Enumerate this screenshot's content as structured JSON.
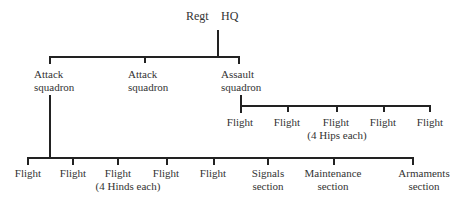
{
  "root": {
    "label_left": "Regt",
    "label_right": "HQ"
  },
  "squadrons": [
    {
      "line1": "Attack",
      "line2": "squadron"
    },
    {
      "line1": "Attack",
      "line2": "squadron"
    },
    {
      "line1": "Assault",
      "line2": "squadron"
    }
  ],
  "assault_flights": {
    "items": [
      "Flight",
      "Flight",
      "Flight",
      "Flight",
      "Flight"
    ],
    "note": "(4 Hips each)"
  },
  "attack_units": {
    "flights": [
      "Flight",
      "Flight",
      "Flight",
      "Flight",
      "Flight"
    ],
    "note": "(4 Hinds each)",
    "sections": [
      {
        "line1": "Signals",
        "line2": "section"
      },
      {
        "line1": "Maintenance",
        "line2": "section"
      },
      {
        "line1": "Armaments",
        "line2": "section"
      }
    ]
  }
}
